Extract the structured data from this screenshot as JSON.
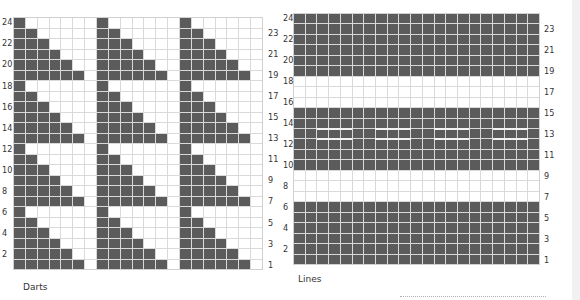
{
  "charts": [
    {
      "id": "darts",
      "caption": "Darts",
      "rows": 24,
      "cols": 21,
      "left_labels": [
        "24",
        "22",
        "20",
        "18",
        "16",
        "14",
        "12",
        "10",
        "8",
        "6",
        "4",
        "2"
      ],
      "right_labels": [
        "23",
        "21",
        "19",
        "17",
        "15",
        "13",
        "11",
        "9",
        "7",
        "5",
        "3",
        "1"
      ],
      "pattern": "triangles: 3 column groups of 7 (6 pattern + 1 blank); 4 row blocks of 6; within a block, top row has 1 filled cell increasing to 6 filled in bottom row",
      "colors": {
        "filled": "#5b5b5b",
        "empty": "#ffffff",
        "gridline": "#d9d9d9"
      }
    },
    {
      "id": "lines",
      "caption": "Lines",
      "rows": 24,
      "cols": 21,
      "left_labels": [
        "24",
        "22",
        "20",
        "18",
        "16",
        "14",
        "12",
        "10",
        "8",
        "6",
        "4",
        "2"
      ],
      "right_labels": [
        "23",
        "21",
        "19",
        "17",
        "15",
        "13",
        "11",
        "9",
        "7",
        "5",
        "3",
        "1"
      ],
      "filled_row_ranges": [
        [
          1,
          6
        ],
        [
          10,
          15
        ],
        [
          19,
          24
        ]
      ],
      "empty_row_ranges": [
        [
          7,
          9
        ],
        [
          16,
          18
        ]
      ],
      "dash_row": 13,
      "dash_column_ranges": [
        [
          3,
          5
        ],
        [
          8,
          10
        ],
        [
          13,
          15
        ],
        [
          18,
          20
        ]
      ],
      "colors": {
        "filled": "#5b5b5b",
        "empty": "#ffffff",
        "dash": "#f2f2f2"
      }
    }
  ]
}
